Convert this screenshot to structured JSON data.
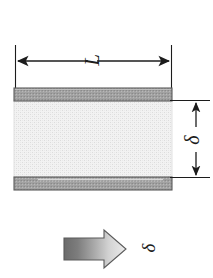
{
  "figure": {
    "labels": {
      "length": "L",
      "gap": "δ",
      "flow": "δ"
    },
    "label_rotation_deg": -90,
    "colors": {
      "plate_fill": "#9c9c9c",
      "plate_stroke": "#4a4a4a",
      "fluid_fill": "#efefef",
      "fluid_stroke": "#c9c9c9",
      "line": "#1c1c1c",
      "arrow_dark": "#6e6e6e",
      "arrow_light": "#e8e8e8",
      "arrow_stroke": "#5a5a5a",
      "background": "#ffffff"
    },
    "geometry": {
      "body_left": 14,
      "body_right": 172,
      "top_plate_y": 88,
      "top_plate_height": 13,
      "bottom_plate_y": 177,
      "bottom_plate_height": 13,
      "length_dim_y": 61,
      "gap_dim_x": 196
    },
    "elements": {
      "top_plate": "upper-plate",
      "bottom_plate": "lower-plate",
      "fluid": "fluid-layer",
      "length_dimension": "length-dimension-L",
      "gap_dimension": "gap-dimension-delta",
      "flow_arrow": "flow-direction-arrow"
    }
  }
}
